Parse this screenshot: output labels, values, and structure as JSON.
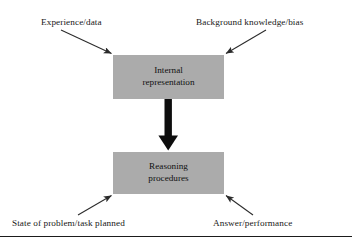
{
  "diagram": {
    "boxes": [
      {
        "id": "internal-representation",
        "line1": "Internal",
        "line2": "representation",
        "fill": "#ababab"
      },
      {
        "id": "reasoning-procedures",
        "line1": "Reasoning",
        "line2": "procedures",
        "fill": "#ababab"
      }
    ],
    "labels": {
      "top_left": "Experience/data",
      "top_right": "Background knowledge/bias",
      "bottom_left": "State of problem/task planned",
      "bottom_right": "Answer/performance"
    },
    "arrows": [
      {
        "id": "experience-to-internal",
        "direction": "down-right",
        "from": "Experience/data",
        "to": "Internal representation"
      },
      {
        "id": "background-to-internal",
        "direction": "down-left",
        "from": "Background knowledge/bias",
        "to": "Internal representation"
      },
      {
        "id": "internal-to-reasoning",
        "direction": "down",
        "from": "Internal representation",
        "to": "Reasoning procedures",
        "style": "thick-block"
      },
      {
        "id": "reasoning-to-state",
        "direction": "up-right",
        "from": "State of problem/task planned",
        "to": "Reasoning procedures"
      },
      {
        "id": "reasoning-to-answer",
        "direction": "up-left",
        "from": "Answer/performance",
        "to": "Reasoning procedures"
      }
    ],
    "colors": {
      "box_fill": "#ababab",
      "stroke": "#2b2b2b",
      "thick_arrow": "#0d0d0d",
      "rule": "#1b1b1b",
      "text": "#171717",
      "background": "#ffffff"
    }
  }
}
